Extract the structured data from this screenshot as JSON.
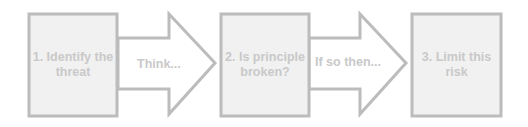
{
  "colors": {
    "border": "#bcbcbc",
    "box_fill": "#f1f1f1",
    "arrow_fill": "#ffffff",
    "text": "#c9c9c9"
  },
  "steps": [
    {
      "label": "1. Identify the threat"
    },
    {
      "label": "2. Is principle broken?"
    },
    {
      "label": "3. Limit this risk"
    }
  ],
  "arrows": [
    {
      "label": "Think..."
    },
    {
      "label": "If so then..."
    }
  ]
}
